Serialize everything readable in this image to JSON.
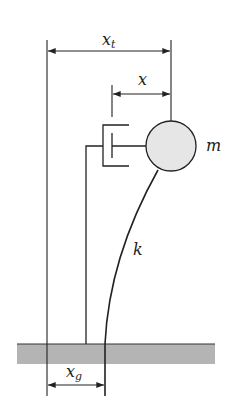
{
  "diagram": {
    "labels": {
      "total_displacement": {
        "base": "x",
        "sub": "t"
      },
      "relative_displacement": {
        "base": "x",
        "sub": ""
      },
      "mass": {
        "base": "m",
        "sub": ""
      },
      "stiffness": {
        "base": "k",
        "sub": ""
      },
      "ground_displacement": {
        "base": "x",
        "sub": "g"
      }
    },
    "colors": {
      "stroke": "#222222",
      "mass_fill": "#e6e6e6",
      "ground_fill": "#b4b4b4"
    }
  }
}
